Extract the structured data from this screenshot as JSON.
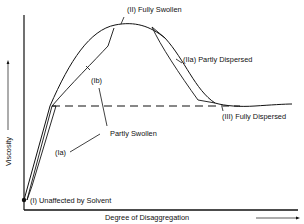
{
  "diagram": {
    "type": "viscosity-vs-disaggregation curve",
    "axes": {
      "x_label": "Degree of Disaggregation",
      "y_label": "Viscosity"
    },
    "labels": {
      "fully_swollen": "(II) Fully Swollen",
      "partly_dispersed": "(IIa) Partly Dispersed",
      "fully_dispersed": "(III) Fully Dispersed",
      "partly_swollen": "Partly Swollen",
      "ib": "(Ib)",
      "ia": "(Ia)",
      "unaffected": "(I) Unaffected by Solvent"
    },
    "colors": {
      "line": "#111111",
      "background": "#ffffff"
    }
  }
}
